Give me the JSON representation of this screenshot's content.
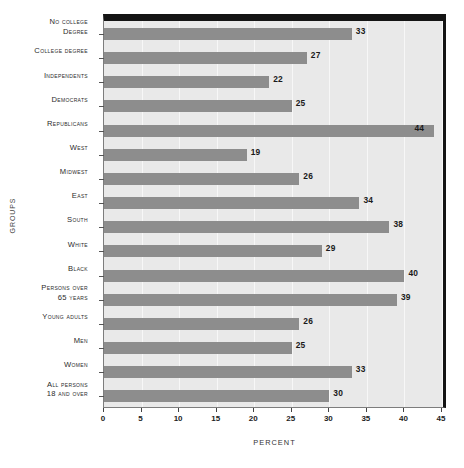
{
  "chart_data": {
    "type": "bar",
    "orientation": "horizontal",
    "title": "",
    "xlabel": "Percent",
    "ylabel": "Groups",
    "xlim": [
      0,
      45
    ],
    "xticks": [
      0,
      5,
      10,
      15,
      20,
      25,
      30,
      35,
      40,
      45
    ],
    "grid": true,
    "legend": false,
    "bar_color": "#8d8d8d",
    "plot_background": "#e9e9e9",
    "categories": [
      "No college degree",
      "College degree",
      "Independents",
      "Democrats",
      "Republicans",
      "West",
      "Midwest",
      "East",
      "South",
      "White",
      "Black",
      "Persons over 65 years",
      "Young adults",
      "Men",
      "Women",
      "All persons 18 and over"
    ],
    "category_lines": [
      [
        "No college",
        "degree"
      ],
      [
        "College degree"
      ],
      [
        "Independents"
      ],
      [
        "Democrats"
      ],
      [
        "Republicans"
      ],
      [
        "West"
      ],
      [
        "Midwest"
      ],
      [
        "East"
      ],
      [
        "South"
      ],
      [
        "White"
      ],
      [
        "Black"
      ],
      [
        "Persons over",
        "65 years"
      ],
      [
        "Young adults"
      ],
      [
        "Men"
      ],
      [
        "Women"
      ],
      [
        "All persons",
        "18 and over"
      ]
    ],
    "values": [
      33,
      27,
      22,
      25,
      44,
      19,
      26,
      34,
      38,
      29,
      40,
      39,
      26,
      25,
      33,
      30
    ]
  }
}
